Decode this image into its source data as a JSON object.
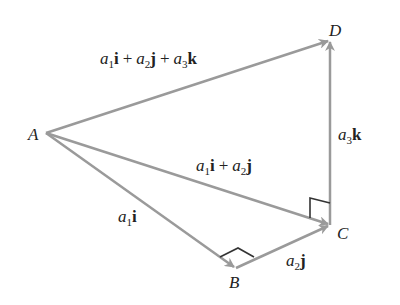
{
  "diagram": {
    "type": "vector-decomposition",
    "points": {
      "A": {
        "label": "A",
        "x": 46,
        "y": 133
      },
      "B": {
        "label": "B",
        "x": 236,
        "y": 268
      },
      "C": {
        "label": "C",
        "x": 330,
        "y": 225
      },
      "D": {
        "label": "D",
        "x": 330,
        "y": 40
      }
    },
    "vectors": [
      {
        "from": "A",
        "to": "B",
        "label": "a1 i",
        "parts": [
          {
            "coef": "a",
            "sub": "1",
            "unit": "i"
          }
        ]
      },
      {
        "from": "B",
        "to": "C",
        "label": "a2 j",
        "parts": [
          {
            "coef": "a",
            "sub": "2",
            "unit": "j"
          }
        ]
      },
      {
        "from": "A",
        "to": "C",
        "label": "a1 i + a2 j",
        "parts": [
          {
            "coef": "a",
            "sub": "1",
            "unit": "i"
          },
          {
            "coef": "a",
            "sub": "2",
            "unit": "j"
          }
        ]
      },
      {
        "from": "C",
        "to": "D",
        "label": "a3 k",
        "parts": [
          {
            "coef": "a",
            "sub": "3",
            "unit": "k"
          }
        ]
      },
      {
        "from": "A",
        "to": "D",
        "label": "a1 i + a2 j + a3 k",
        "parts": [
          {
            "coef": "a",
            "sub": "1",
            "unit": "i"
          },
          {
            "coef": "a",
            "sub": "2",
            "unit": "j"
          },
          {
            "coef": "a",
            "sub": "3",
            "unit": "k"
          }
        ]
      }
    ],
    "right_angles": [
      "B",
      "C"
    ],
    "plus": "+",
    "colors": {
      "arrow": "#9a9a9a",
      "right_angle_mark": "#333333",
      "text": "#222222",
      "background": "#ffffff"
    }
  }
}
